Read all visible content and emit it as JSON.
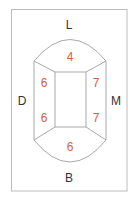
{
  "diagram": {
    "type": "tooth-surface-chart",
    "colors": {
      "border": "#b5b5b5",
      "lines": "#a9a9a9",
      "labels": "#333333",
      "values": "#d9603b"
    },
    "directions": {
      "top": "L",
      "bottom": "B",
      "left": "D",
      "right": "M"
    },
    "surfaces": {
      "top": "4",
      "left_upper": "6",
      "left_lower": "6",
      "right_upper": "7",
      "right_lower": "7",
      "bottom": "6"
    }
  }
}
